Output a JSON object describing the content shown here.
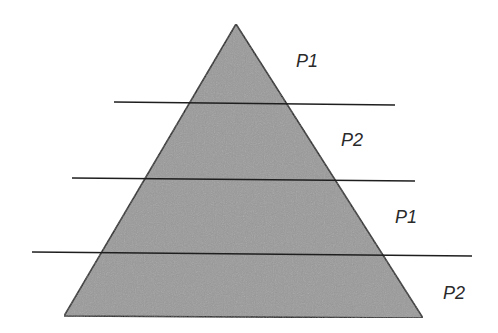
{
  "diagram": {
    "type": "layered-pyramid",
    "fill_color": "#9a9a9a",
    "stroke_color": "#1e1e1e",
    "triangle": {
      "apex": [
        236,
        24
      ],
      "base_left": [
        64,
        316
      ],
      "base_right": [
        423,
        318
      ]
    },
    "divider_lines": [
      {
        "x1": 114,
        "y1": 102,
        "x2": 395,
        "y2": 105
      },
      {
        "x1": 72,
        "y1": 178,
        "x2": 415,
        "y2": 181
      },
      {
        "x1": 32,
        "y1": 252,
        "x2": 472,
        "y2": 256
      }
    ],
    "labels": [
      {
        "text": "P1",
        "x": 296,
        "y": 52
      },
      {
        "text": "P2",
        "x": 341,
        "y": 131
      },
      {
        "text": "P1",
        "x": 395,
        "y": 208
      },
      {
        "text": "P2",
        "x": 443,
        "y": 284
      }
    ]
  }
}
